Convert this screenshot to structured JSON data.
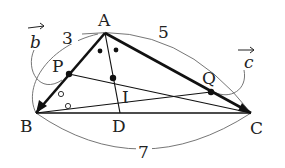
{
  "diagram": {
    "type": "triangle-geometry",
    "points": {
      "A": {
        "label": "A",
        "x": 105,
        "y": 33
      },
      "B": {
        "label": "B",
        "x": 36,
        "y": 113
      },
      "C": {
        "label": "C",
        "x": 251,
        "y": 113
      },
      "D": {
        "label": "D",
        "x": 120,
        "y": 113
      },
      "I": {
        "label": "I",
        "x": 113,
        "y": 78
      },
      "P": {
        "label": "P",
        "x": 69,
        "y": 74
      },
      "Q": {
        "label": "Q",
        "x": 211,
        "y": 92
      }
    },
    "vectors": {
      "b": {
        "label": "b",
        "from": "B",
        "to": "A"
      },
      "c": {
        "label": "c",
        "from": "B",
        "to": "C"
      }
    },
    "lengths": {
      "AB": "3",
      "AC": "5",
      "BC": "7"
    },
    "segments": [
      "AB",
      "AC",
      "BC",
      "AD",
      "BQ",
      "CP"
    ],
    "angle_marks": {
      "A": "•",
      "B": "∘"
    },
    "colors": {
      "stroke": "#111111",
      "arc": "#555555",
      "text": "#222222"
    }
  }
}
